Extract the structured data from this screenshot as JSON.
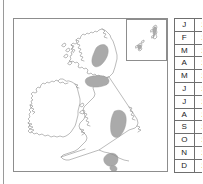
{
  "figure": {
    "type": "distribution-map",
    "region": "British Isles",
    "shading_color": "#aaaaaa",
    "outline_color": "#8d8d8d",
    "background_color": "#ffffff"
  },
  "map": {
    "name": "british-isles-distribution-map",
    "inset": {
      "name": "northern-isles-inset",
      "islands": [
        "Shetland",
        "Orkney"
      ]
    },
    "shaded_regions": [
      {
        "name": "north-west-highlands-patch"
      },
      {
        "name": "southern-uplands-patch"
      },
      {
        "name": "pennines-patch"
      },
      {
        "name": "southern-england-patch"
      },
      {
        "name": "southern-england-small-patch"
      }
    ]
  },
  "month_table": {
    "name": "monthly-records-table",
    "rows": [
      {
        "month": "J",
        "value": "2"
      },
      {
        "month": "F",
        "value": "2"
      },
      {
        "month": "M",
        "value": "2"
      },
      {
        "month": "A",
        "value": "2"
      },
      {
        "month": "M",
        "value": "2"
      },
      {
        "month": "J",
        "value": "2"
      },
      {
        "month": "J",
        "value": "2"
      },
      {
        "month": "A",
        "value": "2"
      },
      {
        "month": "S",
        "value": "2"
      },
      {
        "month": "O",
        "value": "2"
      },
      {
        "month": "N",
        "value": "2"
      },
      {
        "month": "D",
        "value": "2"
      }
    ]
  }
}
